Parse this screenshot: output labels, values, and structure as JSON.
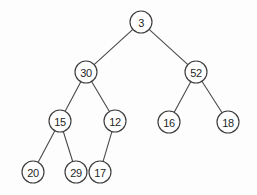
{
  "figure": {
    "background_color": "#fdfdfd",
    "node_stroke_color": "#3d3d3d",
    "node_fill_color": "#ffffff",
    "edge_color": "#4a4a4a",
    "label_color": "#1f1f1f",
    "node_radius": 11,
    "width": 257,
    "height": 195
  },
  "chart_data": {
    "type": "diagram",
    "diagram_type": "binary-tree",
    "root": "3",
    "levels": 4,
    "nodes": [
      {
        "id": "n3",
        "label": "3",
        "x": 141,
        "y": 22,
        "level": 0
      },
      {
        "id": "n30",
        "label": "30",
        "x": 86,
        "y": 72,
        "level": 1
      },
      {
        "id": "n52",
        "label": "52",
        "x": 196,
        "y": 72,
        "level": 1
      },
      {
        "id": "n15",
        "label": "15",
        "x": 60,
        "y": 121,
        "level": 2
      },
      {
        "id": "n12",
        "label": "12",
        "x": 115,
        "y": 121,
        "level": 2
      },
      {
        "id": "n16",
        "label": "16",
        "x": 169,
        "y": 122,
        "level": 2
      },
      {
        "id": "n18",
        "label": "18",
        "x": 228,
        "y": 122,
        "level": 2
      },
      {
        "id": "n20",
        "label": "20",
        "x": 33,
        "y": 172,
        "level": 3
      },
      {
        "id": "n29",
        "label": "29",
        "x": 76,
        "y": 172,
        "level": 3
      },
      {
        "id": "n17",
        "label": "17",
        "x": 100,
        "y": 172,
        "level": 3
      }
    ],
    "edges": [
      {
        "from": "n3",
        "to": "n30",
        "side": "left"
      },
      {
        "from": "n3",
        "to": "n52",
        "side": "right"
      },
      {
        "from": "n30",
        "to": "n15",
        "side": "left"
      },
      {
        "from": "n30",
        "to": "n12",
        "side": "right"
      },
      {
        "from": "n52",
        "to": "n16",
        "side": "left"
      },
      {
        "from": "n52",
        "to": "n18",
        "side": "right"
      },
      {
        "from": "n15",
        "to": "n20",
        "side": "left"
      },
      {
        "from": "n15",
        "to": "n29",
        "side": "right"
      },
      {
        "from": "n12",
        "to": "n17",
        "side": "left"
      }
    ]
  }
}
